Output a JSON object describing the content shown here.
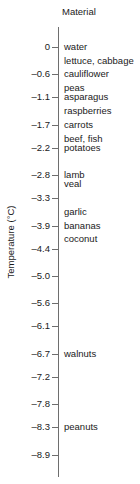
{
  "chart_data": {
    "type": "scatter",
    "title": "",
    "xlabel": "",
    "ylabel": "Temperature (°C)",
    "column_header": "Material",
    "grid": false,
    "legend": "none",
    "ylim": [
      -9.2,
      0.55
    ],
    "y_ticks": [
      0,
      -0.6,
      -1.1,
      -1.7,
      -2.2,
      -2.8,
      -3.3,
      -3.9,
      -4.4,
      -5.0,
      -5.6,
      -6.1,
      -6.7,
      -7.2,
      -7.8,
      -8.3,
      -8.9
    ],
    "y_tick_labels": [
      "0",
      "–0.6",
      "–1.1",
      "–1.7",
      "–2.2",
      "–2.8",
      "–3.3",
      "–3.9",
      "–4.4",
      "–5.0",
      "–5.6",
      "–6.1",
      "–6.7",
      "–7.2",
      "–7.8",
      "–8.3",
      "–8.9"
    ],
    "categories": [
      "water",
      "lettuce, cabbage",
      "cauliflower",
      "peas",
      "asparagus",
      "raspberries",
      "carrots",
      "beef, fish",
      "potatoes",
      "lamb",
      "veal",
      "garlic",
      "bananas",
      "coconut",
      "walnuts",
      "peanuts"
    ],
    "values": [
      0.0,
      -0.3,
      -0.6,
      -0.9,
      -1.1,
      -1.4,
      -1.7,
      -2.0,
      -2.2,
      -2.8,
      -3.0,
      -3.6,
      -3.9,
      -4.2,
      -6.7,
      -8.3
    ]
  }
}
